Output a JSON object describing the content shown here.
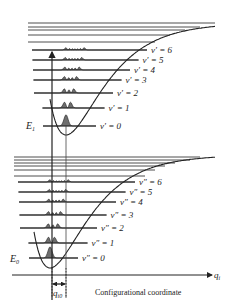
{
  "figure": {
    "upper_state": {
      "energy_label": "E",
      "energy_sub": "1",
      "levels": [
        "v′ = 0",
        "v′ = 1",
        "v′ = 2",
        "v′ = 3",
        "v′ = 4",
        "v′ = 5",
        "v′ = 6"
      ]
    },
    "lower_state": {
      "energy_label": "E",
      "energy_sub": "0",
      "levels": [
        "v″ = 0",
        "v″ = 1",
        "v″ = 2",
        "v″ = 3",
        "v″ = 4",
        "v″ = 5",
        "v″ = 6"
      ]
    },
    "axis": {
      "label": "q",
      "label_sub": "i",
      "caption": "Configurational coordinate"
    },
    "displacement": {
      "label": "q",
      "label_sub": "i0"
    },
    "colors": {
      "line": "#222222",
      "fill": "#6e6e6e"
    }
  }
}
